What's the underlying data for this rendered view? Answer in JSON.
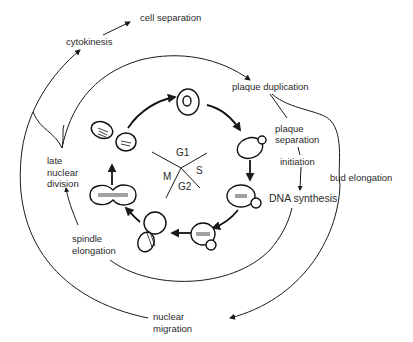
{
  "diagram": {
    "phases": {
      "g1": "G1",
      "s": "S",
      "g2": "G2",
      "m": "M"
    },
    "events": {
      "cell_separation": "cell separation",
      "cytokinesis": "cytokinesis",
      "plaque_duplication": "plaque duplication",
      "plaque_separation_1": "plaque",
      "plaque_separation_2": "separation",
      "initiation": "initiation",
      "dna_synthesis": "DNA synthesis",
      "bud_elongation": "bud elongation",
      "late_nuclear_division_1": "late",
      "late_nuclear_division_2": "nuclear",
      "late_nuclear_division_3": "division",
      "spindle_elongation_1": "spindle",
      "spindle_elongation_2": "elongation",
      "nuclear_migration_1": "nuclear",
      "nuclear_migration_2": "migration"
    },
    "cell_stages": [
      "unbudded G1 cell",
      "early bud",
      "bud growth with spindle",
      "large bud",
      "nuclear migration into neck",
      "spindle elongation",
      "late nuclear division"
    ],
    "colors": {
      "ink": "#1a1a1a",
      "background": "#ffffff"
    }
  }
}
